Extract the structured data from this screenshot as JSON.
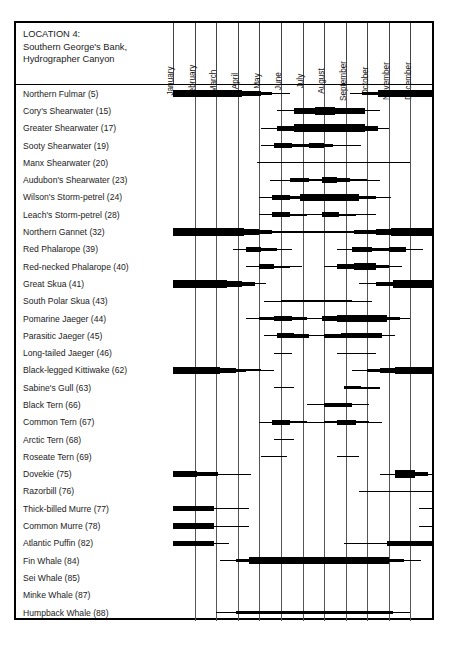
{
  "header": {
    "location_lines": [
      "LOCATION 4:",
      "Southern George's Bank,",
      "Hydrographer Canyon"
    ]
  },
  "chart_data": {
    "type": "bar",
    "subtitle": "Seasonal occurrence and relative abundance of marine birds and mammals",
    "xlabel": "",
    "ylabel": "",
    "grid": true,
    "legend": "none",
    "xlim": [
      0,
      12
    ],
    "categories": [
      "January",
      "February",
      "March",
      "April",
      "May",
      "June",
      "July",
      "August",
      "September",
      "October",
      "November",
      "December"
    ],
    "encoding": "Horizontal bar thickness encodes relative abundance across the calendar year; months are columns, species are rows. Segment start/end are in month units (0 = Jan 1, 12 = Dec 31). Thickness levels: 1 = hairline (rare/occasional), 2 = thin, 3 = medium, 4 = thick, 5 = very thick (abundant).",
    "series": [
      {
        "name": "Northern Fulmar (5)",
        "code": 5,
        "segments": [
          [
            0,
            3.2,
            5
          ],
          [
            3.2,
            4.1,
            4
          ],
          [
            4.1,
            4.6,
            3
          ],
          [
            4.6,
            5.4,
            1
          ],
          [
            8.2,
            8.75,
            1
          ],
          [
            8.75,
            9.5,
            3
          ],
          [
            9.5,
            12,
            5
          ]
        ]
      },
      {
        "name": "Cory's Shearwater (15)",
        "code": 15,
        "segments": [
          [
            4.8,
            5.6,
            1
          ],
          [
            5.6,
            6.6,
            4
          ],
          [
            6.6,
            7.5,
            5
          ],
          [
            7.5,
            8.9,
            4
          ],
          [
            8.9,
            9.6,
            1
          ]
        ]
      },
      {
        "name": "Greater Shearwater (17)",
        "code": 17,
        "segments": [
          [
            4.1,
            4.8,
            1
          ],
          [
            4.8,
            5.6,
            4
          ],
          [
            5.6,
            8.9,
            5
          ],
          [
            8.9,
            9.5,
            4
          ],
          [
            9.5,
            10.0,
            1
          ]
        ]
      },
      {
        "name": "Sooty Shearwater (19)",
        "code": 19,
        "segments": [
          [
            4.1,
            4.7,
            1
          ],
          [
            4.7,
            5.5,
            4
          ],
          [
            5.5,
            6.3,
            2
          ],
          [
            6.3,
            7.0,
            4
          ],
          [
            7.0,
            7.4,
            2
          ],
          [
            7.4,
            8.7,
            1
          ]
        ]
      },
      {
        "name": "Manx Shearwater (20)",
        "code": 20,
        "segments": [
          [
            3.9,
            11.0,
            1
          ]
        ]
      },
      {
        "name": "Audubon's Shearwater (23)",
        "code": 23,
        "segments": [
          [
            4.5,
            5.4,
            1
          ],
          [
            5.4,
            6.3,
            3
          ],
          [
            6.3,
            6.9,
            2
          ],
          [
            6.9,
            7.6,
            4
          ],
          [
            7.6,
            8.2,
            3
          ],
          [
            8.2,
            9.0,
            2
          ],
          [
            9.0,
            9.6,
            1
          ]
        ]
      },
      {
        "name": "Wilson's Storm-petrel (24)",
        "code": 24,
        "segments": [
          [
            4.0,
            4.6,
            1
          ],
          [
            4.6,
            5.4,
            4
          ],
          [
            5.4,
            5.9,
            3
          ],
          [
            5.9,
            8.6,
            5
          ],
          [
            8.6,
            9.4,
            3
          ],
          [
            9.4,
            10.1,
            1
          ]
        ]
      },
      {
        "name": "Leach's Storm-petrel (28)",
        "code": 28,
        "segments": [
          [
            4.0,
            4.6,
            1
          ],
          [
            4.6,
            5.4,
            4
          ],
          [
            5.4,
            6.2,
            2
          ],
          [
            6.2,
            6.9,
            1
          ],
          [
            6.9,
            7.7,
            4
          ],
          [
            7.7,
            8.5,
            2
          ],
          [
            8.5,
            9.4,
            1
          ]
        ]
      },
      {
        "name": "Northern Gannet (32)",
        "code": 32,
        "segments": [
          [
            0,
            3.3,
            5
          ],
          [
            3.3,
            4.0,
            4
          ],
          [
            4.0,
            4.6,
            3
          ],
          [
            4.6,
            8.4,
            2
          ],
          [
            8.4,
            9.4,
            3
          ],
          [
            9.4,
            10.1,
            4
          ],
          [
            10.1,
            12,
            5
          ]
        ]
      },
      {
        "name": "Red Phalarope (39)",
        "code": 39,
        "segments": [
          [
            2.8,
            3.4,
            1
          ],
          [
            3.4,
            4.1,
            4
          ],
          [
            4.1,
            4.8,
            3
          ],
          [
            4.8,
            5.5,
            1
          ],
          [
            7.6,
            8.3,
            1
          ],
          [
            8.3,
            9.2,
            4
          ],
          [
            9.2,
            10.0,
            3
          ],
          [
            10.0,
            10.8,
            4
          ],
          [
            10.8,
            11.6,
            1
          ]
        ]
      },
      {
        "name": "Red-necked Phalarope (40)",
        "code": 40,
        "segments": [
          [
            3.4,
            4.0,
            1
          ],
          [
            4.0,
            4.7,
            4
          ],
          [
            4.7,
            5.4,
            2
          ],
          [
            5.4,
            6.0,
            1
          ],
          [
            7.0,
            7.6,
            1
          ],
          [
            7.6,
            8.4,
            4
          ],
          [
            8.4,
            9.4,
            5
          ],
          [
            9.4,
            10.0,
            3
          ],
          [
            10.0,
            10.6,
            1
          ]
        ]
      },
      {
        "name": "Great Skua (41)",
        "code": 41,
        "segments": [
          [
            0,
            2.5,
            5
          ],
          [
            2.5,
            3.2,
            4
          ],
          [
            3.2,
            3.8,
            3
          ],
          [
            3.8,
            4.3,
            1
          ],
          [
            8.6,
            9.4,
            1
          ],
          [
            9.4,
            10.2,
            3
          ],
          [
            10.2,
            11.2,
            5
          ],
          [
            11.2,
            12,
            5
          ]
        ]
      },
      {
        "name": "South Polar Skua (43)",
        "code": 43,
        "segments": [
          [
            4.2,
            5.0,
            1
          ],
          [
            5.0,
            8.3,
            2
          ],
          [
            8.3,
            9.2,
            1
          ]
        ]
      },
      {
        "name": "Pomarine Jaeger (44)",
        "code": 44,
        "segments": [
          [
            3.4,
            4.0,
            1
          ],
          [
            4.0,
            4.7,
            3
          ],
          [
            4.7,
            5.5,
            4
          ],
          [
            5.5,
            6.2,
            3
          ],
          [
            6.2,
            6.9,
            1
          ],
          [
            6.9,
            7.6,
            4
          ],
          [
            7.6,
            9.9,
            5
          ],
          [
            9.9,
            10.5,
            3
          ],
          [
            10.5,
            11.0,
            1
          ]
        ]
      },
      {
        "name": "Parasitic Jaeger (45)",
        "code": 45,
        "segments": [
          [
            4.2,
            4.8,
            1
          ],
          [
            4.8,
            5.6,
            4
          ],
          [
            5.6,
            6.3,
            3
          ],
          [
            6.3,
            7.0,
            1
          ],
          [
            7.0,
            7.8,
            3
          ],
          [
            7.8,
            9.7,
            4
          ],
          [
            9.7,
            10.3,
            1
          ]
        ]
      },
      {
        "name": "Long-tailed Jaeger (46)",
        "code": 46,
        "segments": [
          [
            4.7,
            5.5,
            1
          ],
          [
            7.6,
            9.4,
            1
          ]
        ]
      },
      {
        "name": "Black-legged Kittiwake (62)",
        "code": 62,
        "segments": [
          [
            0,
            2.2,
            5
          ],
          [
            2.2,
            2.9,
            4
          ],
          [
            2.9,
            3.4,
            3
          ],
          [
            3.4,
            4.1,
            2
          ],
          [
            4.1,
            4.7,
            1
          ],
          [
            8.3,
            9.0,
            1
          ],
          [
            9.0,
            9.6,
            3
          ],
          [
            9.6,
            10.3,
            4
          ],
          [
            10.3,
            11.0,
            5
          ],
          [
            11.0,
            12,
            5
          ]
        ]
      },
      {
        "name": "Sabine's Gull (63)",
        "code": 63,
        "segments": [
          [
            4.7,
            5.6,
            1
          ],
          [
            7.9,
            8.7,
            3
          ],
          [
            8.7,
            9.6,
            2
          ]
        ]
      },
      {
        "name": "Black Tern (66)",
        "code": 66,
        "segments": [
          [
            6.2,
            7.0,
            1
          ],
          [
            7.0,
            8.3,
            3
          ],
          [
            8.3,
            9.1,
            1
          ]
        ]
      },
      {
        "name": "Common Tern (67)",
        "code": 67,
        "segments": [
          [
            4.0,
            4.6,
            1
          ],
          [
            4.6,
            5.4,
            4
          ],
          [
            5.4,
            6.2,
            2
          ],
          [
            6.2,
            7.0,
            1
          ],
          [
            7.0,
            7.6,
            2
          ],
          [
            7.6,
            8.5,
            4
          ],
          [
            8.5,
            9.1,
            2
          ],
          [
            9.1,
            9.7,
            1
          ]
        ]
      },
      {
        "name": "Arctic Tern (68)",
        "code": 68,
        "segments": [
          [
            4.7,
            5.6,
            1
          ]
        ]
      },
      {
        "name": "Roseate Tern (69)",
        "code": 69,
        "segments": [
          [
            4.1,
            5.3,
            1
          ],
          [
            7.6,
            8.6,
            1
          ]
        ]
      },
      {
        "name": "Dovekie (75)",
        "code": 75,
        "segments": [
          [
            0,
            1.1,
            4
          ],
          [
            1.1,
            2.1,
            3
          ],
          [
            2.1,
            2.8,
            1
          ],
          [
            2.8,
            3.6,
            1
          ],
          [
            9.6,
            10.3,
            1
          ],
          [
            10.3,
            11.2,
            5
          ],
          [
            11.2,
            11.8,
            3
          ],
          [
            11.8,
            12,
            1
          ]
        ]
      },
      {
        "name": "Razorbill (76)",
        "code": 76,
        "segments": [
          [
            8.6,
            12,
            1
          ]
        ]
      },
      {
        "name": "Thick-billed Murre (77)",
        "code": 77,
        "segments": [
          [
            0,
            1.9,
            4
          ],
          [
            1.9,
            2.6,
            1
          ],
          [
            2.6,
            3.5,
            1
          ],
          [
            11.4,
            12,
            1
          ]
        ]
      },
      {
        "name": "Common Murre (78)",
        "code": 78,
        "segments": [
          [
            0,
            1.9,
            4
          ],
          [
            1.9,
            2.6,
            1
          ],
          [
            2.6,
            3.5,
            1
          ],
          [
            11.4,
            12,
            1
          ]
        ]
      },
      {
        "name": "Atlantic Puffin (82)",
        "code": 82,
        "segments": [
          [
            0,
            1.9,
            4
          ],
          [
            1.9,
            2.6,
            1
          ],
          [
            7.9,
            9.9,
            1
          ],
          [
            9.9,
            12,
            4
          ]
        ]
      },
      {
        "name": "Fin Whale (84)",
        "code": 84,
        "segments": [
          [
            2.2,
            2.9,
            1
          ],
          [
            2.9,
            3.5,
            3
          ],
          [
            3.5,
            10.0,
            5
          ],
          [
            10.0,
            10.7,
            3
          ],
          [
            10.7,
            11.5,
            1
          ]
        ]
      },
      {
        "name": "Sei Whale (85)",
        "code": 85,
        "segments": []
      },
      {
        "name": "Minke Whale (87)",
        "code": 87,
        "segments": []
      },
      {
        "name": "Humpback Whale (88)",
        "code": 88,
        "segments": [
          [
            2.0,
            2.9,
            1
          ],
          [
            2.9,
            10.2,
            3
          ],
          [
            10.2,
            11.0,
            1
          ]
        ]
      }
    ]
  }
}
